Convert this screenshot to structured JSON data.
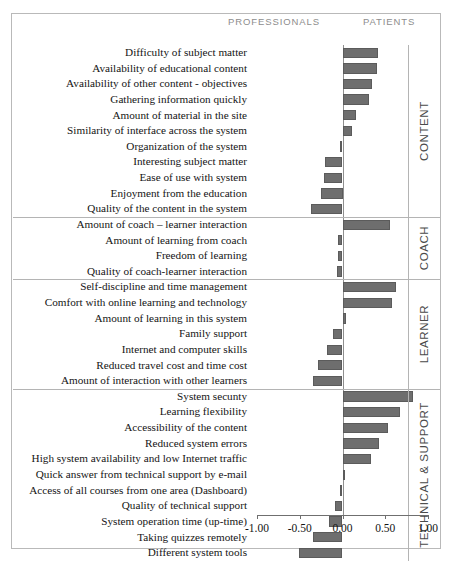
{
  "header": {
    "left_caption": "PROFESSIONALS",
    "right_caption": "PATIENTS"
  },
  "axis": {
    "tick_labels": [
      "-1.00",
      "-0.50",
      "0.00",
      "0.50",
      "1.00"
    ],
    "tick_values": [
      -1,
      -0.5,
      0,
      0.5,
      1
    ]
  },
  "sections": [
    {
      "name": "CONTENT"
    },
    {
      "name": "COACH"
    },
    {
      "name": "LEARNER"
    },
    {
      "name": "TECHNICAL & SUPPORT"
    }
  ],
  "chart_data": {
    "type": "bar",
    "orientation": "horizontal",
    "title": "",
    "subtitle": "",
    "xlabel": "",
    "ylabel": "",
    "xlim": [
      -1.0,
      1.0
    ],
    "grid": false,
    "legend": [
      "PROFESSIONALS",
      "PATIENTS"
    ],
    "legend_position": "top",
    "bar_color": "#6e6e6e",
    "note": "Negative values lean toward PROFESSIONALS, positive values lean toward PATIENTS.",
    "groups": [
      {
        "name": "CONTENT",
        "categories": [
          "Difficulty of subject matter",
          "Availability of educational content",
          "Availability of other content - objectives",
          "Gathering information quickly",
          "Amount of material in the site",
          "Similarity of interface across the system",
          "Organization of the system",
          "Interesting subject matter",
          "Ease of use with system",
          "Enjoyment from the education",
          "Quality of the content in the system"
        ],
        "values": [
          0.42,
          0.4,
          0.34,
          0.31,
          0.16,
          0.11,
          -0.03,
          -0.21,
          -0.22,
          -0.25,
          -0.37
        ]
      },
      {
        "name": "COACH",
        "categories": [
          "Amount of coach – learner interaction",
          "Amount of learning from coach",
          "Freedom of learning",
          "Quality of coach-learner interaction"
        ],
        "values": [
          0.56,
          -0.05,
          -0.05,
          -0.06
        ]
      },
      {
        "name": "LEARNER",
        "categories": [
          "Self-discipline and time management",
          "Comfort with online learning and technology",
          "Amount of learning in this system",
          "Family support",
          "Internet and computer skills",
          "Reduced travel cost and time cost",
          "Amount of interaction with other learners"
        ],
        "values": [
          0.63,
          0.58,
          0.04,
          -0.11,
          -0.18,
          -0.29,
          -0.34
        ]
      },
      {
        "name": "TECHNICAL & SUPPORT",
        "categories": [
          "System secunty",
          "Learning flexibility",
          "Accessibility of the content",
          "Reduced system errors",
          "High system availability and low Internet traffic",
          "Quick answer from technical support by e-mail",
          "Access of all courses from one area (Dashboard)",
          "Quality of technical support",
          "System operation time (up-time)",
          "Taking quizzes remotely",
          "Different system tools"
        ],
        "values": [
          0.82,
          0.67,
          0.53,
          0.43,
          0.33,
          0.01,
          -0.03,
          -0.09,
          -0.16,
          -0.34,
          -0.51
        ]
      }
    ]
  }
}
